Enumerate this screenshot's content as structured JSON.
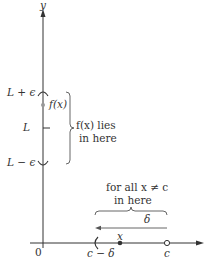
{
  "figure": {
    "axes": {
      "y_label": "y",
      "origin_label": "0"
    },
    "y_axis_labels": {
      "upper": "L + ϵ",
      "middle": "L",
      "lower": "L − ϵ",
      "fx_point": "f(x)"
    },
    "y_brace_text": {
      "line1": "f(x) lies",
      "line2": "in here"
    },
    "x_brace_text": {
      "line1": "for all x ≠ c",
      "line2": "in here"
    },
    "delta_label": "δ",
    "x_axis_labels": {
      "left_bound": "c − δ",
      "point_x": "x",
      "point_c": "c"
    },
    "colors": {
      "line": "#333333",
      "brace": "#555555",
      "dot": "#333333",
      "fx_dot": "#999999"
    }
  }
}
